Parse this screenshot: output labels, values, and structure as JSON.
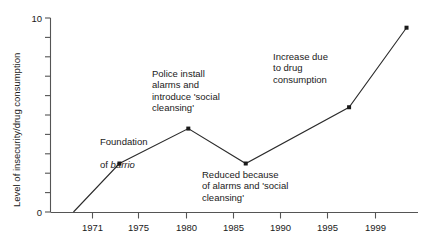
{
  "chart_data": {
    "type": "line",
    "title": "",
    "xlabel": "",
    "ylabel": "Level of insecurity/drug consumption",
    "xlim": [
      1969,
      2001
    ],
    "ylim": [
      0,
      10
    ],
    "grid": false,
    "legend": "none",
    "x_ticks": [
      "1971",
      "1975",
      "1980",
      "1985",
      "1990",
      "1995",
      "1999"
    ],
    "x_tick_values": [
      1971,
      1975,
      1980,
      1985,
      1990,
      1995,
      1999
    ],
    "y_ticks": [
      "0",
      "10"
    ],
    "y_tick_values": [
      0,
      1,
      2,
      3,
      4,
      5,
      6,
      7,
      8,
      9,
      10
    ],
    "y_labeled_ticks": [
      0,
      10
    ],
    "series": [
      {
        "name": "Level of insecurity/drug consumption",
        "x": [
          1971,
          1975,
          1981,
          1986,
          1995,
          2000
        ],
        "values": [
          0,
          2.5,
          4.3,
          2.5,
          5.4,
          9.5
        ],
        "marker": "square",
        "color": "#1a1a1a"
      }
    ],
    "annotations": [
      {
        "id": "foundation",
        "line1": "Foundation",
        "line2_prefix": "of ",
        "line2_italic": "barrio",
        "text": "Foundation of barrio",
        "points_to_year": 1975
      },
      {
        "id": "police-install",
        "text": "Police install\nalarms and\nintroduce 'social\ncleansing'",
        "points_to_year": 1981
      },
      {
        "id": "reduced-because",
        "text": "Reduced because\nof alarms and 'social\ncleansing'",
        "points_to_year": 1986
      },
      {
        "id": "increase-due",
        "text": "Increase due\nto drug\nconsumption",
        "points_to_year": 1995
      }
    ],
    "colors": {
      "line": "#2b2b2b",
      "axis": "#555555",
      "text": "#1a1a1a",
      "background": "#ffffff"
    }
  }
}
